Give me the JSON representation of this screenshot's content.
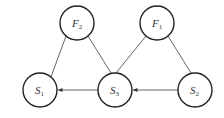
{
  "diagram": {
    "nodes": [
      {
        "id": "F2",
        "base": "F",
        "sub": "2",
        "cx": 77,
        "cy": 23
      },
      {
        "id": "F1",
        "base": "F",
        "sub": "1",
        "cx": 157,
        "cy": 23
      },
      {
        "id": "S1",
        "base": "S",
        "sub": "1",
        "cx": 40,
        "cy": 90
      },
      {
        "id": "S3",
        "base": "S",
        "sub": "3",
        "cx": 115,
        "cy": 90
      },
      {
        "id": "S2",
        "base": "S",
        "sub": "2",
        "cx": 195,
        "cy": 90
      }
    ],
    "edges": [
      {
        "from": "F2",
        "to": "S1",
        "directed": false
      },
      {
        "from": "F2",
        "to": "S3",
        "directed": false
      },
      {
        "from": "F1",
        "to": "S3",
        "directed": false
      },
      {
        "from": "F1",
        "to": "S2",
        "directed": false
      },
      {
        "from": "S3",
        "to": "S1",
        "directed": true
      },
      {
        "from": "S2",
        "to": "S3",
        "directed": true
      }
    ],
    "colors": {
      "stroke": "#222222",
      "edge": "#555555"
    }
  }
}
